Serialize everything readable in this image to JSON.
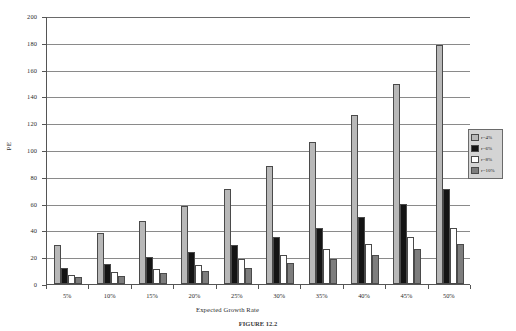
{
  "chart_data": {
    "type": "bar",
    "title": "",
    "xlabel": "Expected Growth Rate",
    "ylabel": "PE",
    "categories": [
      "5%",
      "10%",
      "15%",
      "20%",
      "25%",
      "30%",
      "35%",
      "40%",
      "45%",
      "50%"
    ],
    "ylim": [
      0,
      200
    ],
    "ytick_values": [
      0,
      20,
      40,
      60,
      80,
      100,
      120,
      140,
      160,
      180,
      200
    ],
    "ytick_labels": [
      "0",
      "20",
      "40",
      "60",
      "80",
      "100",
      "120",
      "140",
      "160",
      "180",
      "200"
    ],
    "grid": true,
    "legend_position": "right",
    "series": [
      {
        "name": "r=4%",
        "color": "#b8b8b8",
        "values": [
          29,
          38,
          47,
          58,
          71,
          88,
          106,
          126,
          149,
          178
        ]
      },
      {
        "name": "r=6%",
        "color": "#141414",
        "values": [
          12,
          15,
          20,
          24,
          29,
          35,
          42,
          50,
          60,
          71
        ]
      },
      {
        "name": "r=8%",
        "color": "#ffffff",
        "values": [
          7,
          9,
          11,
          14,
          19,
          22,
          26,
          30,
          35,
          42
        ]
      },
      {
        "name": "r=10%",
        "color": "#7d7d7d",
        "values": [
          5,
          6,
          8,
          10,
          12,
          16,
          19,
          22,
          26,
          30
        ]
      }
    ]
  },
  "legend": {
    "items": [
      {
        "label": "r=4%"
      },
      {
        "label": "r=6%"
      },
      {
        "label": "r=8%"
      },
      {
        "label": "r=10%"
      }
    ]
  },
  "caption": {
    "text": "FIGURE 12.2"
  }
}
